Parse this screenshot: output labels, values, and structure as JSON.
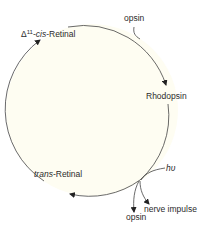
{
  "diagram": {
    "type": "cycle",
    "colors": {
      "circle_fill": "#fefdf2",
      "stroke": "#444444",
      "text": "#2b2b2b"
    },
    "nodes": {
      "cis_retinal": {
        "delta": "Δ",
        "sup": "11",
        "prefix": "-",
        "italic": "cis",
        "suffix": "-Retinal"
      },
      "rhodopsin": {
        "label": "Rhodopsin"
      },
      "trans_retinal": {
        "italic": "trans",
        "suffix": "-Retinal"
      }
    },
    "inputs": {
      "opsin_in": "opsin",
      "light": "hυ"
    },
    "outputs": {
      "nerve_impulse": "nerve impulse",
      "opsin_out": "opsin"
    }
  }
}
